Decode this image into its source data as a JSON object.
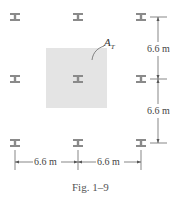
{
  "figure": {
    "caption": "Fig. 1–9",
    "area_label": "A",
    "area_label_sub": "T",
    "dimensions": {
      "vertical_top": "6.6 m",
      "vertical_bottom": "6.6 m",
      "horizontal_left": "6.6 m",
      "horizontal_right": "6.6 m"
    },
    "columns": {
      "icon": "wide-flange-column-icon",
      "grid": "3x3",
      "color": "#8a8a8a"
    },
    "tributary_area_color": "#e4e4e4"
  }
}
